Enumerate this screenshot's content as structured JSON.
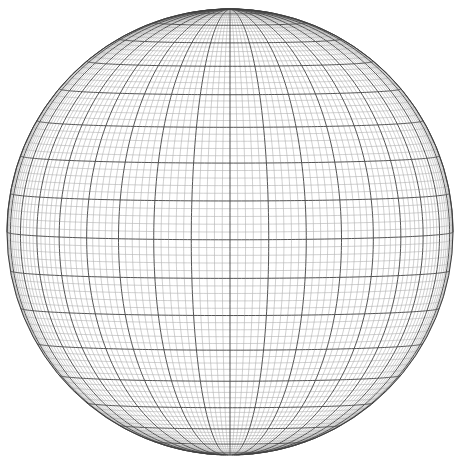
{
  "figure": {
    "type": "wireframe-sphere",
    "background_color": "#ffffff"
  },
  "chart_data": {
    "type": "line",
    "subtitle": "",
    "xlabel": "",
    "ylabel": "",
    "projection": "orthographic",
    "grid": true,
    "legend_position": "none",
    "sphere": {
      "center_x": 230,
      "center_y": 232,
      "radius": 223,
      "view_longitude_deg": 0,
      "view_latitude_deg": 2,
      "rotation_deg": 0
    },
    "graticule": {
      "minor_step_deg": 2,
      "major_step_deg": 10,
      "lat_range_deg": [
        -90,
        90
      ],
      "lon_range_deg": [
        -180,
        180
      ],
      "minor_color": "#a8a8a8",
      "major_color": "#4a4a4a",
      "limb_color": "#3d3d3d",
      "minor_width": 0.55,
      "major_width": 0.95
    },
    "features": {
      "north_pole_visible": true,
      "south_pole_visible": true,
      "north_pole_px": [
        230,
        9
      ],
      "south_pole_px": [
        230,
        455
      ],
      "equator_px_y": 232,
      "left_limb_px_x": 7,
      "right_limb_px_x": 453,
      "top_limb_px_y": 9,
      "bottom_limb_px_y": 455
    },
    "major_parallels_deg": [
      -80,
      -70,
      -60,
      -50,
      -40,
      -30,
      -20,
      -10,
      0,
      10,
      20,
      30,
      40,
      50,
      60,
      70,
      80
    ],
    "major_meridians_deg": [
      -180,
      -170,
      -160,
      -150,
      -140,
      -130,
      -120,
      -110,
      -100,
      -90,
      -80,
      -70,
      -60,
      -50,
      -40,
      -30,
      -20,
      -10,
      0,
      10,
      20,
      30,
      40,
      50,
      60,
      70,
      80,
      90,
      100,
      110,
      120,
      130,
      140,
      150,
      160,
      170
    ],
    "categories": [],
    "values": []
  }
}
